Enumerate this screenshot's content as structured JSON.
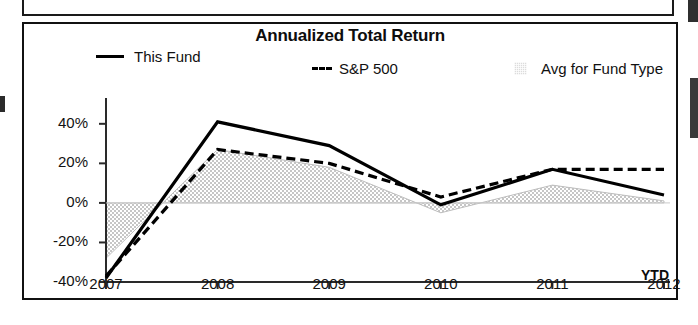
{
  "chart_data": {
    "type": "line",
    "title": "Annualized Total Return",
    "xlabel": "",
    "ylabel": "",
    "axis_note": "YTD",
    "categories": [
      "2007",
      "2008",
      "2009",
      "2010",
      "2011",
      "2012"
    ],
    "x_tick_labels": [
      "2007",
      "2008",
      "2009",
      "2010",
      "2011",
      "2012"
    ],
    "y_tick_labels": [
      "40%",
      "20%",
      "0%",
      "-20%",
      "-40%"
    ],
    "y_tick_values": [
      40,
      20,
      0,
      -20,
      -40
    ],
    "ylim": [
      -40,
      48
    ],
    "grid": false,
    "legend_position": "top",
    "series": [
      {
        "name": "This Fund",
        "style": "solid-line",
        "color": "#000000",
        "values": [
          -38,
          41,
          29,
          -1,
          17,
          4
        ]
      },
      {
        "name": "S&P 500",
        "style": "dashed-line",
        "color": "#000000",
        "values": [
          -37,
          27,
          20,
          3,
          17,
          17
        ]
      },
      {
        "name": "Avg for Fund Type",
        "style": "filled-area",
        "color": "#dcdcdc",
        "values": [
          -28,
          27,
          18,
          -5,
          9,
          1
        ]
      }
    ]
  },
  "legend": {
    "entries": [
      {
        "label": "This Fund",
        "swatch": "solid-line-swatch"
      },
      {
        "label": "S&P 500",
        "swatch": "dashed-line-swatch"
      },
      {
        "label": "Avg for Fund Type",
        "swatch": "area-swatch"
      }
    ]
  },
  "colors": {
    "line": "#000000",
    "area_fill": "#dcdcdc",
    "axis": "#2a2a2a",
    "panel_border": "#111111",
    "text": "#111111"
  }
}
